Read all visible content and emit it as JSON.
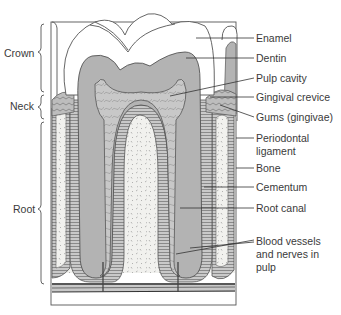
{
  "diagram": {
    "regions": [
      {
        "label": "Crown"
      },
      {
        "label": "Neck"
      },
      {
        "label": "Root"
      }
    ],
    "labels": [
      {
        "label": "Enamel"
      },
      {
        "label": "Dentin"
      },
      {
        "label": "Pulp cavity"
      },
      {
        "label": "Gingival crevice"
      },
      {
        "label": "Gums (gingivae)"
      },
      {
        "label": "Periodontal",
        "label2": "ligament"
      },
      {
        "label": "Bone"
      },
      {
        "label": "Cementum"
      },
      {
        "label": "Root canal"
      },
      {
        "label": "Blood vessels",
        "label2": "and nerves in",
        "label3": "pulp"
      }
    ],
    "colors": {
      "enamel": "#ffffff",
      "dentin": "#b3b3b3",
      "pulp": "#c4c4c4",
      "bone": "#f1f1ee",
      "ligament": "#9a9a9a",
      "outline": "#555555",
      "text": "#3a3a3a"
    }
  }
}
